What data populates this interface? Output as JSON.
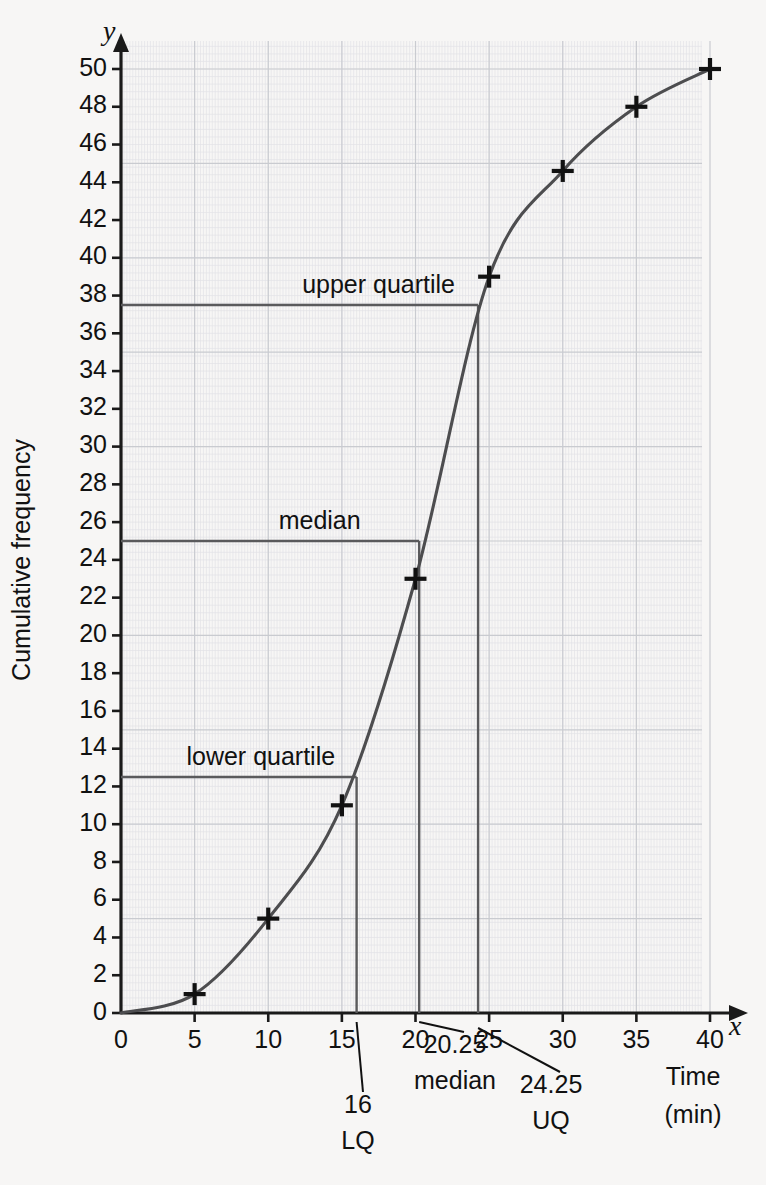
{
  "chart_data": {
    "type": "line",
    "title": "",
    "xlabel": "Time (min)",
    "ylabel": "Cumulative frequency",
    "xlim": [
      0,
      40
    ],
    "ylim": [
      0,
      50
    ],
    "xticks": [
      0,
      5,
      10,
      15,
      20,
      25,
      30,
      35,
      40
    ],
    "xtick_labels": [
      "0",
      "5",
      "10",
      "15",
      "20",
      "25",
      "30",
      "35",
      "40"
    ],
    "yticks": [
      0,
      2,
      4,
      6,
      8,
      10,
      12,
      14,
      16,
      18,
      20,
      22,
      24,
      26,
      28,
      30,
      32,
      34,
      36,
      38,
      40,
      42,
      44,
      46,
      48,
      50
    ],
    "ytick_labels": [
      "0",
      "2",
      "4",
      "6",
      "8",
      "10",
      "12",
      "14",
      "16",
      "18",
      "20",
      "22",
      "24",
      "26",
      "28",
      "30",
      "32",
      "34",
      "36",
      "38",
      "40",
      "42",
      "44",
      "46",
      "48",
      "50"
    ],
    "grid": true,
    "grid_minor_step_x": 1,
    "grid_major_step_x": 5,
    "grid_minor_step_y": 1,
    "grid_major_step_y": 5,
    "series": [
      {
        "name": "Cumulative frequency curve",
        "marker": "plus",
        "x": [
          0,
          5,
          10,
          15,
          20,
          25,
          30,
          35,
          40
        ],
        "y": [
          0,
          1,
          5,
          11,
          23,
          39,
          44.6,
          48,
          50
        ]
      }
    ],
    "guides": [
      {
        "id": "upper-quartile",
        "label": "upper quartile",
        "y": 37.5,
        "x": 24.25,
        "label_x": 16,
        "value_label": "24.25",
        "value_sub": "UQ"
      },
      {
        "id": "median",
        "label": "median",
        "y": 25.0,
        "x": 20.25,
        "label_x": 12,
        "value_label": "20.25",
        "value_sub": "median"
      },
      {
        "id": "lower-quartile",
        "label": "lower quartile",
        "y": 12.5,
        "x": 16.0,
        "label_x": 8,
        "value_label": "16",
        "value_sub": "LQ"
      }
    ],
    "axis_letters": {
      "x": "x",
      "y": "y"
    },
    "xlabel_lines": [
      "Time",
      "(min)"
    ],
    "colors": {
      "background": "#f7f6f5",
      "grid_minor": "#e2e3e6",
      "grid_major": "#c9cbd0",
      "curve": "#4d4d4f",
      "guide": "#5a5a5c",
      "axis": "#1a1a1a",
      "text": "#111111"
    }
  }
}
